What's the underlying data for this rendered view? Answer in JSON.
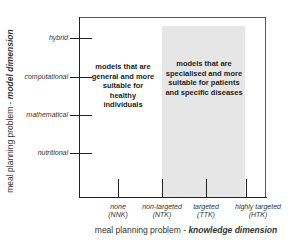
{
  "diagram": {
    "y_axis": {
      "title_prefix": "meal planning problem - ",
      "title_emphasis": "model dimension",
      "ticks": [
        {
          "label": "hybrid",
          "y": 38
        },
        {
          "label": "computational",
          "y": 77
        },
        {
          "label": "mathematical",
          "y": 115
        },
        {
          "label": "nutritional",
          "y": 153
        }
      ]
    },
    "x_axis": {
      "title_prefix": "meal planning problem - ",
      "title_emphasis": "knowledge dimension",
      "ticks": [
        {
          "label": "none",
          "abbr": "(NNK)",
          "x": 118
        },
        {
          "label": "non-targeted",
          "abbr": "(NTK)",
          "x": 162
        },
        {
          "label": "targeted",
          "abbr": "(TTK)",
          "x": 206
        },
        {
          "label": "highly targeted",
          "abbr": "(HTK)",
          "x": 246
        }
      ]
    },
    "regions": [
      {
        "text": "models that are general and more suitable for healthy individuals",
        "fill": "#ffffff"
      },
      {
        "text": "models that are specialised and more suitable for patients and specific diseases",
        "fill": "#e6e6e6"
      }
    ]
  }
}
